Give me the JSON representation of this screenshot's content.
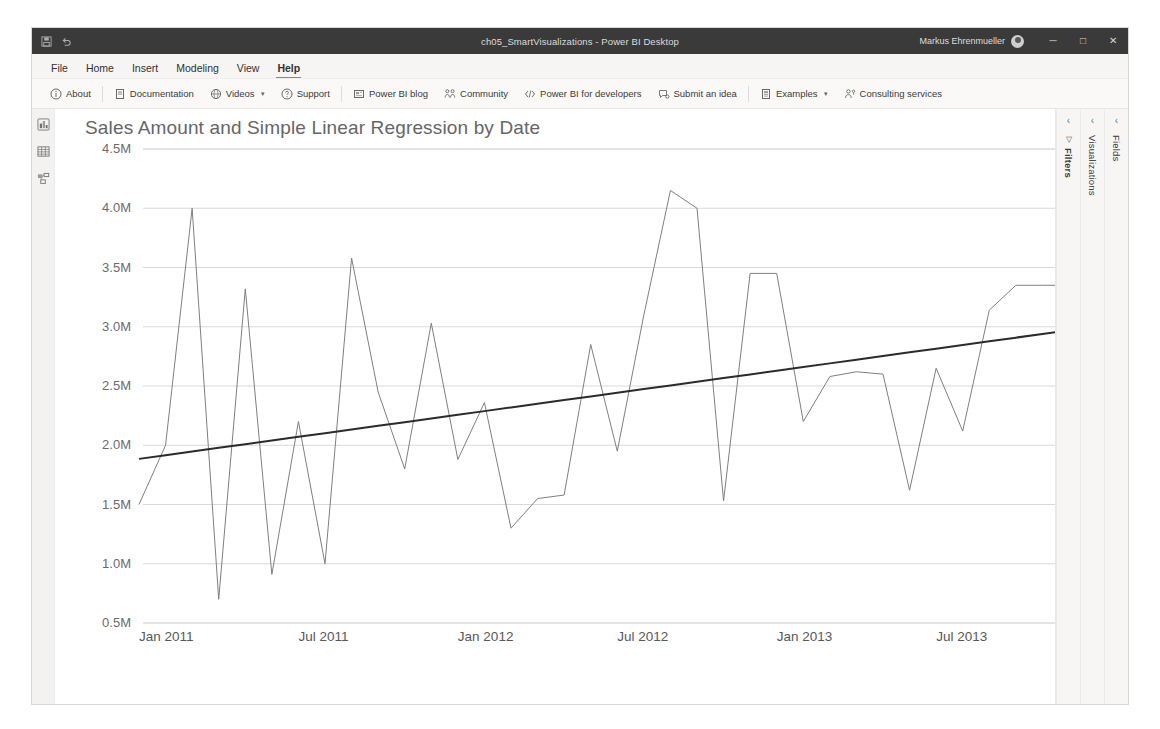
{
  "window": {
    "title": "ch05_SmartVisualizations - Power BI Desktop",
    "user": "Markus Ehrenmueller",
    "quick_access": [
      "save-icon",
      "undo-icon"
    ],
    "controls": {
      "minimize": "─",
      "maximize": "□",
      "close": "✕"
    }
  },
  "menu": {
    "items": [
      {
        "label": "File",
        "active": false
      },
      {
        "label": "Home",
        "active": false
      },
      {
        "label": "Insert",
        "active": false
      },
      {
        "label": "Modeling",
        "active": false
      },
      {
        "label": "View",
        "active": false
      },
      {
        "label": "Help",
        "active": true
      }
    ]
  },
  "ribbon": {
    "groups": [
      {
        "items": [
          {
            "label": "About",
            "icon": "info-circle-icon",
            "chevron": false
          }
        ]
      },
      {
        "items": [
          {
            "label": "Documentation",
            "icon": "document-icon",
            "chevron": false
          },
          {
            "label": "Videos",
            "icon": "video-icon",
            "chevron": true
          },
          {
            "label": "Support",
            "icon": "question-circle-icon",
            "chevron": false
          }
        ]
      },
      {
        "items": [
          {
            "label": "Power BI blog",
            "icon": "blog-icon",
            "chevron": false
          },
          {
            "label": "Community",
            "icon": "community-icon",
            "chevron": false
          },
          {
            "label": "Power BI for developers",
            "icon": "code-icon",
            "chevron": false
          },
          {
            "label": "Submit an idea",
            "icon": "idea-feedback-icon",
            "chevron": false
          }
        ]
      },
      {
        "items": [
          {
            "label": "Examples",
            "icon": "examples-icon",
            "chevron": true
          },
          {
            "label": "Consulting services",
            "icon": "person-services-icon",
            "chevron": false
          }
        ]
      }
    ]
  },
  "left_rail": {
    "items": [
      {
        "name": "report-view-icon",
        "tooltip": "Report"
      },
      {
        "name": "data-view-icon",
        "tooltip": "Data"
      },
      {
        "name": "model-view-icon",
        "tooltip": "Model"
      }
    ]
  },
  "right_panes": [
    {
      "label": "Filters",
      "bold": true,
      "collapse": "‹",
      "has_filter_icon": true
    },
    {
      "label": "Visualizations",
      "bold": false,
      "collapse": "‹",
      "has_filter_icon": false
    },
    {
      "label": "Fields",
      "bold": false,
      "collapse": "‹",
      "has_filter_icon": false
    }
  ],
  "tab_bar": {
    "nav_prev": "◂",
    "nav_next": "▸",
    "add_label": "＋",
    "tabs": [
      {
        "label": "Analytics Trendline",
        "active": false
      },
      {
        "label": "DAX Trendline",
        "active": true
      },
      {
        "label": "Analytics Forecast",
        "active": false
      },
      {
        "label": "Time Series Forecasting Chart",
        "active": false
      },
      {
        "label": "Forecasting with ARIMA",
        "active": false
      },
      {
        "label": "Forecasting TBATS",
        "active": false
      },
      {
        "label": "Time series decomposition",
        "active": false
      },
      {
        "label": "Scatter Chart Trendline",
        "active": false
      },
      {
        "label": "Spline Chart",
        "active": false
      },
      {
        "label": "Cluster",
        "active": false
      }
    ]
  },
  "chart_data": {
    "type": "line",
    "title": "Sales Amount and Simple Linear Regression by Date",
    "xlabel": "",
    "ylabel": "",
    "ylim": [
      500000,
      4500000
    ],
    "ytick_values": [
      4500000,
      4000000,
      3500000,
      3000000,
      2500000,
      2000000,
      1500000,
      1000000,
      500000
    ],
    "ytick_labels": [
      "4.5M",
      "4.0M",
      "3.5M",
      "3.0M",
      "2.5M",
      "2.0M",
      "1.5M",
      "1.0M",
      "0.5M"
    ],
    "xtick_labels": [
      "Jan 2011",
      "Jul 2011",
      "Jan 2012",
      "Jul 2012",
      "Jan 2013",
      "Jul 2013"
    ],
    "xtick_indices": [
      0,
      6,
      12,
      18,
      24,
      30
    ],
    "grid": true,
    "legend": false,
    "x": [
      "Jan 2011",
      "Feb 2011",
      "Mar 2011",
      "Apr 2011",
      "May 2011",
      "Jun 2011",
      "Jul 2011",
      "Aug 2011",
      "Sep 2011",
      "Oct 2011",
      "Nov 2011",
      "Dec 2011",
      "Jan 2012",
      "Feb 2012",
      "Mar 2012",
      "Apr 2012",
      "May 2012",
      "Jun 2012",
      "Jul 2012",
      "Aug 2012",
      "Sep 2012",
      "Oct 2012",
      "Nov 2012",
      "Dec 2012",
      "Jan 2013",
      "Feb 2013",
      "Mar 2013",
      "Apr 2013",
      "May 2013",
      "Jun 2013",
      "Jul 2013",
      "Aug 2013",
      "Sep 2013",
      "Oct 2013",
      "Nov 2013",
      "Dec 2013"
    ],
    "series": [
      {
        "name": "Sales Amount",
        "color": "#7f7f7f",
        "width": 1,
        "values": [
          1500000,
          2000000,
          4000000,
          700000,
          3320000,
          910000,
          2200000,
          1000000,
          3580000,
          2450000,
          1800000,
          3030000,
          1880000,
          2360000,
          1300000,
          1550000,
          1580000,
          2850000,
          1950000,
          3100000,
          4150000,
          4000000,
          1530000,
          3450000,
          3450000,
          2200000,
          2580000,
          2620000,
          2600000,
          1620000,
          2650000,
          2120000,
          3140000,
          3350000,
          3350000,
          3350000
        ]
      },
      {
        "name": "Simple Linear Regression",
        "color": "#2b2b2b",
        "width": 2,
        "values": [
          1885000,
          1916000,
          1947000,
          1978000,
          2009000,
          2040000,
          2071000,
          2102000,
          2133000,
          2164000,
          2195000,
          2226000,
          2257000,
          2288000,
          2319000,
          2350000,
          2381000,
          2412000,
          2443000,
          2474000,
          2505000,
          2536000,
          2567000,
          2598000,
          2629000,
          2660000,
          2691000,
          2722000,
          2753000,
          2784000,
          2815000,
          2846000,
          2877000,
          2908000,
          2939000,
          2970000
        ]
      }
    ]
  }
}
